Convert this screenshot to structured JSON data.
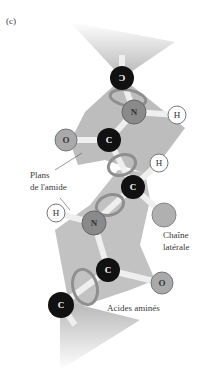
{
  "panel_label": "(c)",
  "labels": {
    "amide_planes_line1": "Plans",
    "amide_planes_line2": "de l'amide",
    "side_chain_line1": "Chaîne",
    "side_chain_line2": "latérale",
    "amino_acids": "Acides aminés"
  },
  "atoms": [
    {
      "id": "c_top",
      "symbol": "C",
      "flipped": true,
      "type": "carbon"
    },
    {
      "id": "n_top",
      "symbol": "N",
      "type": "nitrogen"
    },
    {
      "id": "h_top",
      "symbol": "H",
      "type": "hydrogen"
    },
    {
      "id": "o_left",
      "symbol": "O",
      "type": "oxygen"
    },
    {
      "id": "c_mid_upper",
      "symbol": "C",
      "type": "carbon"
    },
    {
      "id": "h_mid",
      "symbol": "H",
      "type": "hydrogen"
    },
    {
      "id": "c_alpha",
      "symbol": "C",
      "type": "carbon"
    },
    {
      "id": "side_chain",
      "symbol": "",
      "type": "side-chain"
    },
    {
      "id": "h_left",
      "symbol": "H",
      "type": "hydrogen"
    },
    {
      "id": "n_mid",
      "symbol": "N",
      "type": "nitrogen"
    },
    {
      "id": "c_lower",
      "symbol": "C",
      "type": "carbon"
    },
    {
      "id": "o_right",
      "symbol": "O",
      "type": "oxygen"
    },
    {
      "id": "c_bottom",
      "symbol": "C",
      "type": "carbon"
    }
  ],
  "colors": {
    "plane": "#b9b9b9",
    "carbon": "#111111",
    "nitrogen": "#8a8a8a",
    "oxygen": "#a9a9a9",
    "hydrogen": "#ffffff",
    "bond": "#f2f2f2",
    "ribbon": "#9a9a9a"
  }
}
